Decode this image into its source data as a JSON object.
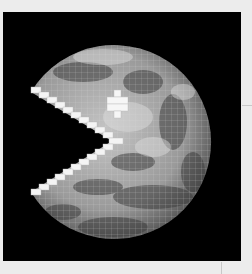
{
  "image": {
    "subject": "Earth globe as Pac-Man",
    "description": "Grayscale Earth with lat/long grid, mouth cut out with pixelated white edges and a white pixel-cross eye, on black square",
    "colors": {
      "page_background": "#ececec",
      "frame": "#000000",
      "pixel_edge": "#f4f4f4",
      "globe_light": "#bdbdbd",
      "globe_dark": "#3a3a3a"
    }
  }
}
